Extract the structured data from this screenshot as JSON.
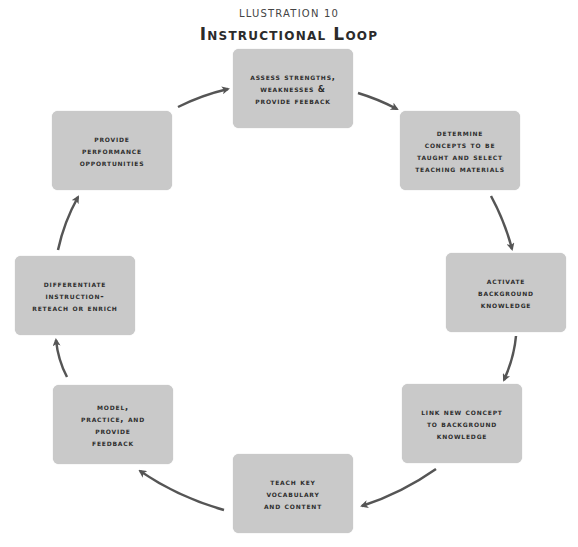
{
  "header": {
    "subtitle": "LLUSTRATION 10",
    "title": "Instructional Loop"
  },
  "colors": {
    "box_fill": "#c9c9c9",
    "arrow": "#555555",
    "text": "#2e2e2e"
  },
  "steps": [
    {
      "id": "assess",
      "label": "Assess strengths,\nweaknesses &\nprovide feeback"
    },
    {
      "id": "determine",
      "label": "Determine\nconcepts to be\ntaught and select\nteaching materials"
    },
    {
      "id": "activate",
      "label": "Activate\nbackground\nknowledge"
    },
    {
      "id": "link",
      "label": "Link new concept\nto background\nknowledge"
    },
    {
      "id": "teach",
      "label": "Teach key\nvocabulary\nand content"
    },
    {
      "id": "model",
      "label": "Model,\npractice, and\nprovide\nfeedback"
    },
    {
      "id": "differentiate",
      "label": "differentiate\ninstruction-\nreteach or enrich"
    },
    {
      "id": "perform",
      "label": "Provide\nperformance\nopportunities"
    }
  ],
  "flow": [
    {
      "from": "assess",
      "to": "determine"
    },
    {
      "from": "determine",
      "to": "activate"
    },
    {
      "from": "activate",
      "to": "link"
    },
    {
      "from": "link",
      "to": "teach"
    },
    {
      "from": "teach",
      "to": "model"
    },
    {
      "from": "model",
      "to": "differentiate"
    },
    {
      "from": "differentiate",
      "to": "perform"
    },
    {
      "from": "perform",
      "to": "assess"
    }
  ]
}
